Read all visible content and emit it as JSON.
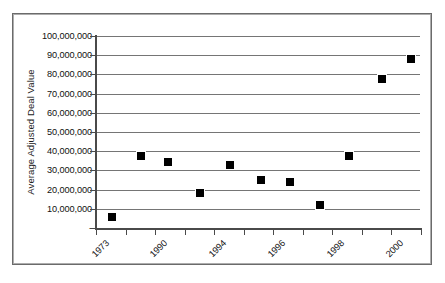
{
  "chart_data": {
    "type": "scatter",
    "title": "",
    "xlabel": "",
    "ylabel": "Average Adjusted Deal Value",
    "ylim": [
      0,
      100000000
    ],
    "grid": true,
    "legend": "none",
    "y_ticks": [
      {
        "value": 100000000,
        "label": "100,000,000"
      },
      {
        "value": 90000000,
        "label": "90,000,000"
      },
      {
        "value": 80000000,
        "label": "80,000,000"
      },
      {
        "value": 70000000,
        "label": "70,000,000"
      },
      {
        "value": 60000000,
        "label": "60,000,000"
      },
      {
        "value": 50000000,
        "label": "50,000,000"
      },
      {
        "value": 40000000,
        "label": "40,000,000"
      },
      {
        "value": 30000000,
        "label": "30,000,000"
      },
      {
        "value": 20000000,
        "label": "20,000,000"
      },
      {
        "value": 10000000,
        "label": "10,000,000"
      },
      {
        "value": 0,
        "label": "-"
      }
    ],
    "x_tick_count": 12,
    "x_tick_labels": [
      "1973",
      "1990",
      "1994",
      "1996",
      "1998",
      "2000"
    ],
    "x_label_tick_indices": [
      0,
      3,
      6,
      9,
      12,
      15
    ],
    "points": [
      {
        "x_index": 0.55,
        "value": 5700000
      },
      {
        "x_index": 1.55,
        "value": 37000000
      },
      {
        "x_index": 2.45,
        "value": 34000000
      },
      {
        "x_index": 3.55,
        "value": 18000000
      },
      {
        "x_index": 4.55,
        "value": 32500000
      },
      {
        "x_index": 5.6,
        "value": 25000000
      },
      {
        "x_index": 6.6,
        "value": 23500000
      },
      {
        "x_index": 7.6,
        "value": 11500000
      },
      {
        "x_index": 8.6,
        "value": 37500000
      },
      {
        "x_index": 9.7,
        "value": 77500000
      },
      {
        "x_index": 10.7,
        "value": 88000000
      }
    ],
    "marker_color": "#000000",
    "grid_color": "#757575",
    "axis_color": "#4a4a4a"
  }
}
